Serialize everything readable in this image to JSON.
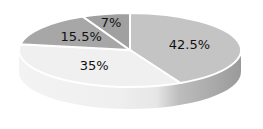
{
  "chart_data": {
    "type": "pie",
    "style": "3d",
    "title": "",
    "start": "top",
    "direction": "clockwise",
    "slices": [
      {
        "label": "42.5%",
        "value": 42.5,
        "color": "#c4c4c4"
      },
      {
        "label": "35%",
        "value": 35,
        "color": "#f0f0f0"
      },
      {
        "label": "15.5%",
        "value": 15.5,
        "color": "#a7a7a7"
      },
      {
        "label": "7%",
        "value": 7,
        "color": "#a0a0a0"
      }
    ],
    "legend": "none"
  }
}
